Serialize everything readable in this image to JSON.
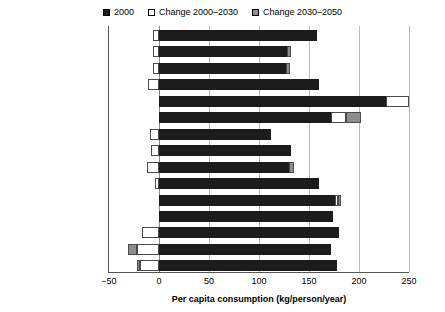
{
  "legend": {
    "items": [
      {
        "label": "2000",
        "swatch": "black-swatch-icon",
        "color": "#1a1a1a"
      },
      {
        "label": "Change 2000–2030",
        "swatch": "white-swatch-icon",
        "color": "#ffffff"
      },
      {
        "label": "Change 2030–2050",
        "swatch": "gray-swatch-icon",
        "color": "#8f8f8f"
      }
    ]
  },
  "axis": {
    "x_title": "Per capita consumption (kg/person/year)",
    "x_ticks": [
      "−50",
      "0",
      "50",
      "100",
      "150",
      "200",
      "250"
    ]
  },
  "chart_data": {
    "type": "bar",
    "orientation": "horizontal",
    "stacked": true,
    "title": "",
    "xlabel": "Per capita consumption (kg/person/year)",
    "ylabel": "",
    "xlim": [
      -50,
      250
    ],
    "xticks": [
      -50,
      0,
      50,
      100,
      150,
      200,
      250
    ],
    "grid": true,
    "legend_position": "top-center",
    "series": [
      {
        "name": "2000",
        "color": "#1a1a1a"
      },
      {
        "name": "Change 2000–2030",
        "color": "#ffffff"
      },
      {
        "name": "Change 2030–2050",
        "color": "#8f8f8f"
      }
    ],
    "categories": [
      "World",
      "United States",
      "High Income",
      "Developing",
      "Middle East and North Africa",
      "East Europe and Central Asia",
      "Brazil",
      "Latin America and Caribbean",
      "Sub-Saharan Africa",
      "India",
      "South Asia minus India",
      "South Asia",
      "China",
      "East Asia minus China",
      "East Asia and Pacific"
    ],
    "rows": [
      {
        "category": "World",
        "v2000": 158,
        "change_2000_2030": -6,
        "change_2030_2050": 0
      },
      {
        "category": "United States",
        "v2000": 128,
        "change_2000_2030": -6,
        "change_2030_2050": 4
      },
      {
        "category": "High Income",
        "v2000": 127,
        "change_2000_2030": -6,
        "change_2030_2050": 4
      },
      {
        "category": "Developing",
        "v2000": 160,
        "change_2000_2030": -11,
        "change_2030_2050": 0
      },
      {
        "category": "Middle East and North Africa",
        "v2000": 227,
        "change_2000_2030": 23,
        "change_2030_2050": 0
      },
      {
        "category": "East Europe and Central Asia",
        "v2000": 172,
        "change_2000_2030": 15,
        "change_2030_2050": 15
      },
      {
        "category": "Brazil",
        "v2000": 112,
        "change_2000_2030": -9,
        "change_2030_2050": 0
      },
      {
        "category": "Latin America and Caribbean",
        "v2000": 132,
        "change_2000_2030": -8,
        "change_2030_2050": 0
      },
      {
        "category": "Sub-Saharan Africa",
        "v2000": 130,
        "change_2000_2030": -12,
        "change_2030_2050": 5
      },
      {
        "category": "India",
        "v2000": 160,
        "change_2000_2030": -4,
        "change_2030_2050": 0
      },
      {
        "category": "South Asia minus India",
        "v2000": 176,
        "change_2000_2030": 3,
        "change_2030_2050": 3
      },
      {
        "category": "South Asia",
        "v2000": 174,
        "change_2000_2030": 0,
        "change_2030_2050": 0
      },
      {
        "category": "China",
        "v2000": 180,
        "change_2000_2030": -17,
        "change_2030_2050": 0
      },
      {
        "category": "East Asia minus China",
        "v2000": 172,
        "change_2000_2030": -22,
        "change_2030_2050": -9
      },
      {
        "category": "East Asia and Pacific",
        "v2000": 178,
        "change_2000_2030": -19,
        "change_2030_2050": -3
      }
    ]
  }
}
